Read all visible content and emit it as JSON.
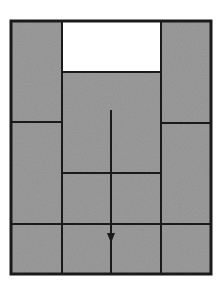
{
  "diagram": {
    "width": 224,
    "height": 291,
    "colors": {
      "background": "#ffffff",
      "fill_gray": "#9d9d9d",
      "empty_cell": "#ffffff",
      "line": "#1a1a1a"
    },
    "outer_frame": {
      "x1": 11,
      "y1": 21,
      "x2": 211,
      "y2": 274
    },
    "empty_slot": {
      "x1": 62,
      "y1": 21,
      "x2": 161,
      "y2": 72,
      "label": "empty slot"
    },
    "pieces": [
      {
        "id": "left-tall",
        "x1": 11,
        "y1": 21,
        "x2": 62,
        "y2": 122
      },
      {
        "id": "right-tall",
        "x1": 161,
        "y1": 21,
        "x2": 211,
        "y2": 123
      },
      {
        "id": "center-large",
        "x1": 62,
        "y1": 72,
        "x2": 161,
        "y2": 173
      },
      {
        "id": "left-mid",
        "x1": 11,
        "y1": 122,
        "x2": 62,
        "y2": 224
      },
      {
        "id": "right-mid",
        "x1": 161,
        "y1": 123,
        "x2": 211,
        "y2": 224
      },
      {
        "id": "center-left-small",
        "x1": 62,
        "y1": 173,
        "x2": 111,
        "y2": 224
      },
      {
        "id": "center-right-small",
        "x1": 111,
        "y1": 173,
        "x2": 161,
        "y2": 224
      },
      {
        "id": "bottom-1",
        "x1": 11,
        "y1": 224,
        "x2": 62,
        "y2": 274
      },
      {
        "id": "bottom-2",
        "x1": 62,
        "y1": 224,
        "x2": 111,
        "y2": 274
      },
      {
        "id": "bottom-3",
        "x1": 111,
        "y1": 224,
        "x2": 161,
        "y2": 274
      },
      {
        "id": "bottom-4",
        "x1": 161,
        "y1": 224,
        "x2": 211,
        "y2": 274
      }
    ],
    "arrow": {
      "x": 111,
      "y_start": 110,
      "y_end": 274,
      "head_top": 233,
      "head_tip": 243,
      "head_half_width": 4,
      "direction": "down"
    }
  }
}
